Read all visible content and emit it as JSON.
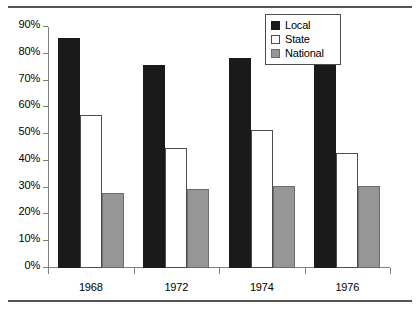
{
  "chart_data": {
    "type": "bar",
    "title": "",
    "subtitle": "",
    "xlabel": "",
    "ylabel": "",
    "categories": [
      "1968",
      "1972",
      "1974",
      "1976"
    ],
    "series": [
      {
        "name": "Local",
        "color": "#1a1a1a",
        "values": [
          86,
          76,
          78.5,
          76
        ]
      },
      {
        "name": "State",
        "color": "#ffffff",
        "values": [
          57,
          45,
          51.5,
          43
        ]
      },
      {
        "name": "National",
        "color": "#969696",
        "values": [
          28,
          29.5,
          30.5,
          30.5
        ]
      }
    ],
    "ylim": [
      0,
      90
    ],
    "ytick_values": [
      0,
      10,
      20,
      30,
      40,
      50,
      60,
      70,
      80,
      90
    ],
    "ytick_labels": [
      "0%",
      "10%",
      "20%",
      "30%",
      "40%",
      "50%",
      "60%",
      "70%",
      "80%",
      "90%"
    ],
    "grid": false,
    "legend_position": "top-right",
    "legend_entries": [
      "Local",
      "State",
      "National"
    ]
  },
  "legend": {
    "items": [
      {
        "label": "Local",
        "swatch": "legend-swatch-local"
      },
      {
        "label": "State",
        "swatch": "legend-swatch-state"
      },
      {
        "label": "National",
        "swatch": "legend-swatch-national"
      }
    ]
  },
  "axes": {
    "y_labels": [
      "90%",
      "80%",
      "70%",
      "60%",
      "50%",
      "40%",
      "30%",
      "20%",
      "10%",
      "0%"
    ],
    "x_labels": [
      "1968",
      "1972",
      "1974",
      "1976"
    ]
  }
}
